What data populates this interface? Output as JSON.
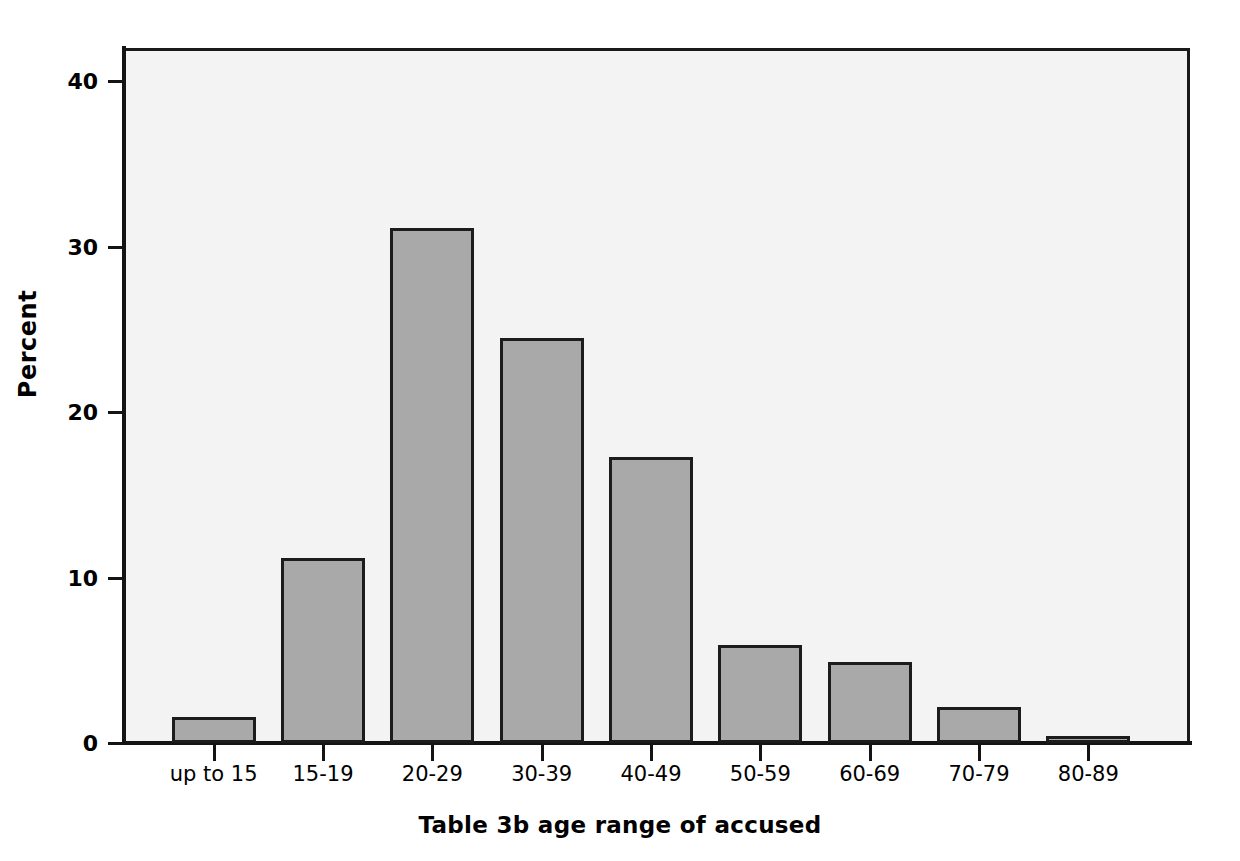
{
  "chart_data": {
    "type": "bar",
    "title": "",
    "subtitle": "",
    "xlabel": "Table 3b age range of accused",
    "ylabel": "Percent",
    "categories": [
      "up to 15",
      "15-19",
      "20-29",
      "30-39",
      "40-49",
      "50-59",
      "60-69",
      "70-79",
      "80-89"
    ],
    "values": [
      1.6,
      11.2,
      31.1,
      24.5,
      17.3,
      5.9,
      4.9,
      2.2,
      0.4
    ],
    "ylim": [
      0,
      42
    ],
    "yticks": [
      0,
      10,
      20,
      30,
      40
    ],
    "ytick_labels": [
      "0",
      "10",
      "20",
      "30",
      "40"
    ],
    "grid": false,
    "legend": "none",
    "bar_fill_color": "#a9a9a9",
    "bar_edge_color": "#1c1c1c",
    "plot_background_color": "#f3f3f3",
    "axis_color": "#141414"
  }
}
